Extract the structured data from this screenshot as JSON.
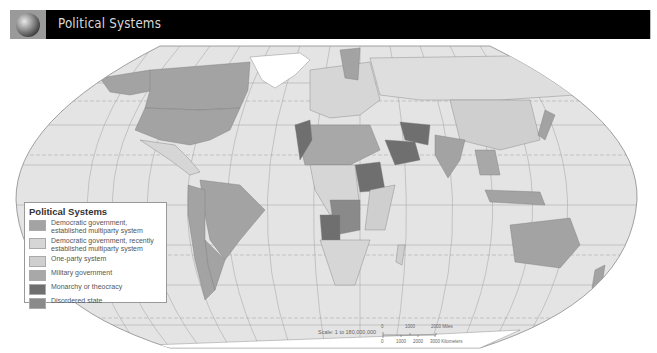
{
  "header": {
    "title": "Political Systems",
    "icon": "globe-icon"
  },
  "legend": {
    "title": "Political Systems",
    "items": [
      {
        "label": "Democratic government, established multiparty system",
        "line1": "Democratic government,",
        "line2": "established multiparty system",
        "color": "#a3a3a3"
      },
      {
        "label": "Democratic government, recently established multiparty system",
        "line1": "Democratic government, recently",
        "line2": "established multiparty system",
        "color": "#d6d6d6"
      },
      {
        "label": "One-party system",
        "line1": "One-party system",
        "color": "#cfcfcf"
      },
      {
        "label": "Military government",
        "line1": "Military government",
        "color": "#a8a8a8"
      },
      {
        "label": "Monarchy or theocracy",
        "line1": "Monarchy or theocracy",
        "color": "#6f6f6f"
      },
      {
        "label": "Disordered state",
        "line1": "Disordered state",
        "color": "#8a8a8a"
      }
    ]
  },
  "scale": {
    "text": "Scale: 1 to 180,000,000",
    "miles_ticks": [
      "0",
      "1000",
      "2000 Miles"
    ],
    "km_ticks": [
      "0",
      "1000",
      "2000",
      "3000 Kilometers"
    ]
  },
  "colors": {
    "ocean": "#e4e4e4",
    "land_default": "#dedede",
    "graticule": "#9c9c9c",
    "header_bg": "#000000",
    "header_text": "#d8d8d8"
  }
}
